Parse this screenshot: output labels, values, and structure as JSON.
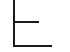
{
  "tree_connector": {
    "line_color": "#1a1a1a",
    "background": "#ffffff",
    "branches": [
      {
        "label": ""
      },
      {
        "label": ""
      }
    ]
  }
}
